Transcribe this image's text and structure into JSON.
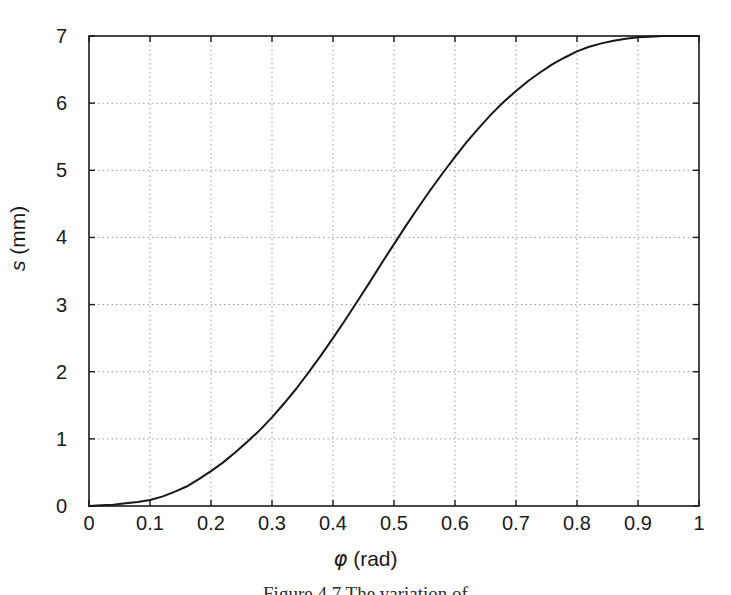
{
  "figure": {
    "caption": "Figure 4.7   The variation of",
    "background_color": "#ffffff",
    "curve_color": "#171717",
    "grid_color": "#9a9a9a",
    "axis_color": "#1a1a1a"
  },
  "axes": {
    "x_title_symbol": "φ",
    "x_title_unit": " (rad)",
    "y_title_symbol": "s",
    "y_title_unit": " (mm)",
    "x_ticks": [
      "0",
      "0.1",
      "0.2",
      "0.3",
      "0.4",
      "0.5",
      "0.6",
      "0.7",
      "0.8",
      "0.9",
      "1"
    ],
    "y_ticks": [
      "0",
      "1",
      "2",
      "3",
      "4",
      "5",
      "6",
      "7"
    ]
  },
  "chart_data": {
    "type": "line",
    "title": "",
    "xlabel": "φ (rad)",
    "ylabel": "s (mm)",
    "xlim": [
      0,
      1
    ],
    "ylim": [
      0,
      7
    ],
    "xticks": [
      0,
      0.1,
      0.2,
      0.3,
      0.4,
      0.5,
      0.6,
      0.7,
      0.8,
      0.9,
      1
    ],
    "yticks": [
      0,
      1,
      2,
      3,
      4,
      5,
      6,
      7
    ],
    "grid": true,
    "legend": null,
    "series": [
      {
        "name": "s(φ)",
        "color": "#171717",
        "line_width": 2.0,
        "x": [
          0.0,
          0.02,
          0.04,
          0.06,
          0.08,
          0.1,
          0.12,
          0.14,
          0.16,
          0.18,
          0.2,
          0.22,
          0.24,
          0.26,
          0.28,
          0.3,
          0.32,
          0.34,
          0.36,
          0.38,
          0.4,
          0.42,
          0.44,
          0.46,
          0.48,
          0.5,
          0.52,
          0.54,
          0.56,
          0.58,
          0.6,
          0.62,
          0.64,
          0.66,
          0.68,
          0.7,
          0.72,
          0.74,
          0.76,
          0.78,
          0.8,
          0.82,
          0.84,
          0.86,
          0.88,
          0.9,
          0.92,
          0.94,
          0.96,
          0.98,
          1.0
        ],
        "y": [
          0.0,
          0.01,
          0.02,
          0.04,
          0.06,
          0.09,
          0.14,
          0.21,
          0.29,
          0.4,
          0.52,
          0.65,
          0.8,
          0.96,
          1.13,
          1.32,
          1.53,
          1.75,
          1.99,
          2.24,
          2.5,
          2.77,
          3.05,
          3.33,
          3.62,
          3.9,
          4.18,
          4.45,
          4.71,
          4.96,
          5.2,
          5.43,
          5.64,
          5.84,
          6.02,
          6.18,
          6.33,
          6.46,
          6.58,
          6.68,
          6.77,
          6.84,
          6.89,
          6.93,
          6.96,
          6.98,
          6.99,
          7.0,
          7.0,
          7.0,
          7.0
        ]
      }
    ]
  }
}
